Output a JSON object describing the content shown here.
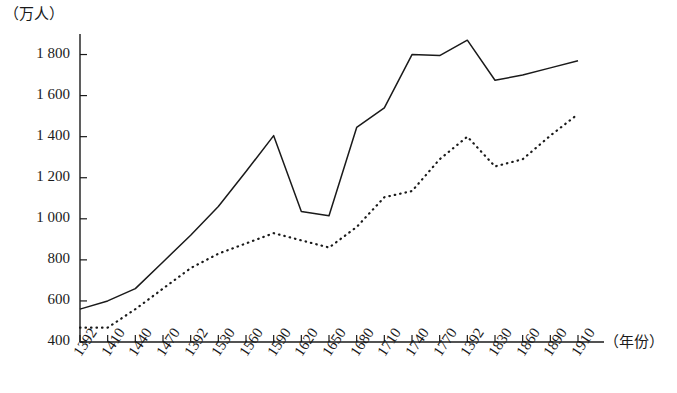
{
  "chart_data": {
    "type": "line",
    "title": "",
    "xlabel": "（年份）",
    "ylabel": "（万人）",
    "ylim": [
      400,
      1900
    ],
    "y_ticks": [
      "400",
      "600",
      "800",
      "1 000",
      "1 200",
      "1 400",
      "1 600",
      "1 800"
    ],
    "y_tick_values": [
      400,
      600,
      800,
      1000,
      1200,
      1400,
      1600,
      1800
    ],
    "grid": false,
    "legend_position": "none",
    "categories": [
      "1392",
      "1410",
      "1440",
      "1470",
      "1392",
      "1530",
      "1560",
      "1590",
      "1620",
      "1650",
      "1680",
      "1710",
      "1740",
      "1770",
      "1392",
      "1830",
      "1860",
      "1890",
      "1910"
    ],
    "series": [
      {
        "name": "solid-line",
        "style": "solid",
        "color": "#1a1a1a",
        "values": [
          560,
          600,
          660,
          790,
          920,
          1060,
          1230,
          1405,
          1035,
          1015,
          1445,
          1540,
          1800,
          1795,
          1870,
          1675,
          1700,
          1735,
          1770
        ]
      },
      {
        "name": "dotted-line",
        "style": "dotted",
        "color": "#1a1a1a",
        "values": [
          470,
          470,
          560,
          660,
          760,
          830,
          880,
          930,
          895,
          860,
          960,
          1105,
          1135,
          1290,
          1400,
          1255,
          1290,
          1405,
          1510
        ]
      }
    ]
  },
  "axes": {
    "y_unit": "（万人）",
    "x_unit": "（年份）"
  }
}
